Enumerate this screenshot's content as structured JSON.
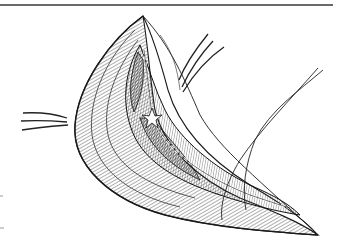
{
  "figure": {
    "elements": {
      "top_rule": {
        "color": "#6a6a6a"
      },
      "left_arrows": {
        "count": 3,
        "icon": "arrow-right-icon"
      },
      "top_arrows": {
        "count": 3,
        "icon": "arrow-down-left-icon"
      },
      "sutures": {
        "count": 2
      },
      "incision": {
        "shape": "crescent"
      }
    },
    "colors": {
      "ink": "#1a1a1a",
      "mid": "#555555",
      "light": "#9a9a9a",
      "paper": "#ffffff"
    }
  }
}
